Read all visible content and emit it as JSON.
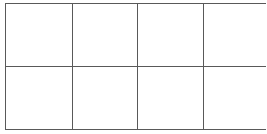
{
  "figure": {
    "name": "blank-grid",
    "type": "grid-diagram",
    "columns": 4,
    "rows": 2,
    "cell_count": 8,
    "background_color": "#ffffff",
    "line_color": "#595959",
    "line_width_px": 1.4,
    "bounds": {
      "left_px": 5,
      "top_px": 3,
      "right_px": 262,
      "bottom_px": 129,
      "width_px": 257,
      "height_px": 126
    },
    "vertical_divider_x_px": [
      71,
      135,
      200
    ],
    "horizontal_divider_y_px": [
      66
    ]
  },
  "cells": [
    {
      "id": "r1c1",
      "row": 1,
      "col": 1,
      "label": ""
    },
    {
      "id": "r1c2",
      "row": 1,
      "col": 2,
      "label": ""
    },
    {
      "id": "r1c3",
      "row": 1,
      "col": 3,
      "label": ""
    },
    {
      "id": "r1c4",
      "row": 1,
      "col": 4,
      "label": ""
    },
    {
      "id": "r2c1",
      "row": 2,
      "col": 1,
      "label": ""
    },
    {
      "id": "r2c2",
      "row": 2,
      "col": 2,
      "label": ""
    },
    {
      "id": "r2c3",
      "row": 2,
      "col": 3,
      "label": ""
    },
    {
      "id": "r2c4",
      "row": 2,
      "col": 4,
      "label": ""
    }
  ]
}
